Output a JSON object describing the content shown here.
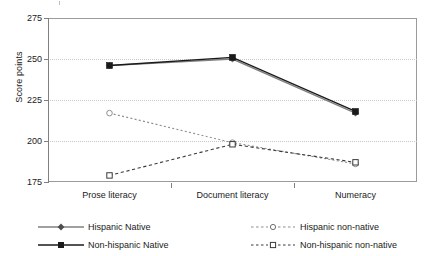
{
  "chart_data": {
    "type": "line",
    "title": "",
    "xlabel": "",
    "ylabel": "Score points",
    "categories": [
      "Prose literacy",
      "Document literacy",
      "Numeracy"
    ],
    "ylim": [
      175,
      275
    ],
    "yticks": [
      175,
      200,
      225,
      250,
      275
    ],
    "grid": true,
    "legend_position": "bottom",
    "series": [
      {
        "name": "Hispanic Native",
        "values": [
          246,
          250,
          217
        ],
        "marker": "diamond",
        "marker_fill": "solid",
        "line_style": "solid",
        "color": "#808080"
      },
      {
        "name": "Non-hispanic Native",
        "values": [
          246,
          251,
          218
        ],
        "marker": "square",
        "marker_fill": "solid",
        "line_style": "solid",
        "color": "#1a1a1a"
      },
      {
        "name": "Hispanic non-native",
        "values": [
          217,
          199,
          186
        ],
        "marker": "circle",
        "marker_fill": "open",
        "line_style": "dotted",
        "color": "#909090"
      },
      {
        "name": "Non-hispanic non-native",
        "values": [
          179,
          198,
          187
        ],
        "marker": "square",
        "marker_fill": "open",
        "line_style": "dashed",
        "color": "#3a3a3a"
      }
    ]
  },
  "axis": {
    "y_title": "Score points",
    "y_tick_labels": [
      "275",
      "250",
      "225",
      "200",
      "175"
    ],
    "x_tick_labels": [
      "Prose literacy",
      "Document literacy",
      "Numeracy"
    ]
  },
  "legend": {
    "entries": [
      {
        "label": "Hispanic Native"
      },
      {
        "label": "Non-hispanic Native"
      },
      {
        "label": "Hispanic non-native"
      },
      {
        "label": "Non-hispanic non-native"
      }
    ]
  },
  "colors": {
    "axis": "#808080",
    "grid": "#c8c8c8",
    "native_hispanic": "#808080",
    "native_nonhispanic": "#1a1a1a",
    "nonnative_hispanic": "#909090",
    "nonnative_nonhispanic": "#3a3a3a",
    "background": "#ffffff"
  }
}
